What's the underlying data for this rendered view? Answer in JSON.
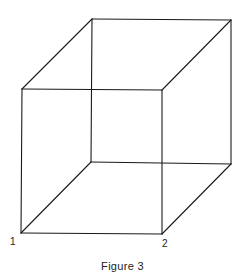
{
  "figure": {
    "caption": "Figure 3",
    "type": "wireframe cube (Necker cube)",
    "stroke_color": "#1a1a1a",
    "vertices": {
      "front_top_left": [
        22,
        89
      ],
      "front_top_right": [
        162,
        90
      ],
      "front_bottom_left": [
        21,
        233
      ],
      "front_bottom_right": [
        162,
        234
      ],
      "back_top_left": [
        92,
        19
      ],
      "back_top_right": [
        231,
        20
      ],
      "back_bottom_left": [
        91,
        162
      ],
      "back_bottom_right": [
        231,
        164
      ]
    },
    "labels": [
      {
        "text": "1",
        "vertex": "front_bottom_left"
      },
      {
        "text": "2",
        "vertex": "front_bottom_right"
      }
    ]
  }
}
